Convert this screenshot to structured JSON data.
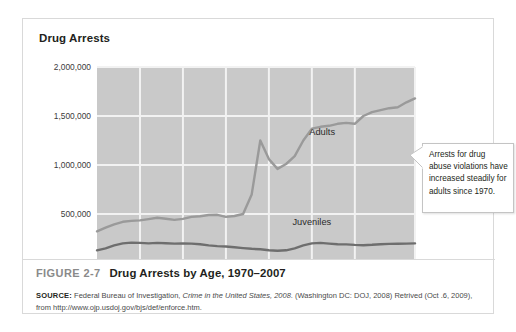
{
  "figure": {
    "number": "FIGURE 2-7",
    "caption": "Drug Arrests by Age, 1970–2007",
    "source_label": "SOURCE:",
    "source_text_1": " Federal Bureau of Investigation, ",
    "source_italic": "Crime in the United States, 2008.",
    "source_text_2": " (Washington DC: DOJ, 2008) Retrived (Oct .6, 2009), from http://www.ojp.usdoj.gov/bjs/def/enforce.htm."
  },
  "callout": {
    "text": "Arrests for drug abuse violations have increased steadily for adults since 1970."
  },
  "colors": {
    "plot_background": "#c9c9c9",
    "gridline": "#f2f2f2",
    "adults_line": "#9a9a9a",
    "juveniles_line": "#6e6e6e",
    "card_border": "#d9d9d9",
    "text": "#231f20",
    "figure_number": "#8a8a8a"
  },
  "chart_data": {
    "type": "line",
    "title": "Drug Arrests",
    "xlabel": "",
    "ylabel": "Drug Arrests",
    "xlim": [
      1970,
      2007
    ],
    "ylim": [
      0,
      2000000
    ],
    "grid": true,
    "legend": "inline-labels",
    "y_ticks": [
      0,
      500000,
      1000000,
      1500000,
      2000000
    ],
    "y_tick_labels": [
      "0",
      "500,000",
      "1,000,000",
      "1,500,000",
      "2,000,000"
    ],
    "x_ticks": [
      1970,
      1975,
      1980,
      1985,
      1990,
      1995,
      2000,
      2007
    ],
    "x_tick_labels": [
      "1970",
      "1975",
      "1980",
      "1985",
      "1990",
      "1995",
      "2000",
      "2007"
    ],
    "x": [
      1970,
      1971,
      1972,
      1973,
      1974,
      1975,
      1976,
      1977,
      1978,
      1979,
      1980,
      1981,
      1982,
      1983,
      1984,
      1985,
      1986,
      1987,
      1988,
      1989,
      1990,
      1991,
      1992,
      1993,
      1994,
      1995,
      1996,
      1997,
      1998,
      1999,
      2000,
      2001,
      2002,
      2003,
      2004,
      2005,
      2006,
      2007
    ],
    "series": [
      {
        "name": "Adults",
        "color": "#9a9a9a",
        "label_x": 1996.2,
        "label_y": 1310000,
        "values": [
          322000,
          360000,
          395000,
          420000,
          430000,
          435000,
          448000,
          462000,
          452000,
          440000,
          450000,
          470000,
          478000,
          490000,
          492000,
          470000,
          480000,
          500000,
          700000,
          1250000,
          1060000,
          960000,
          1010000,
          1090000,
          1250000,
          1370000,
          1390000,
          1400000,
          1420000,
          1430000,
          1420000,
          1500000,
          1540000,
          1560000,
          1580000,
          1590000,
          1640000,
          1680000
        ]
      },
      {
        "name": "Juveniles",
        "color": "#6e6e6e",
        "label_x": 1995.0,
        "label_y": 390000,
        "values": [
          130000,
          150000,
          180000,
          200000,
          208000,
          205000,
          200000,
          205000,
          202000,
          198000,
          200000,
          198000,
          192000,
          180000,
          172000,
          168000,
          160000,
          152000,
          145000,
          140000,
          130000,
          125000,
          130000,
          150000,
          180000,
          200000,
          205000,
          198000,
          192000,
          190000,
          185000,
          182000,
          186000,
          192000,
          195000,
          196000,
          198000,
          200000
        ]
      }
    ]
  }
}
